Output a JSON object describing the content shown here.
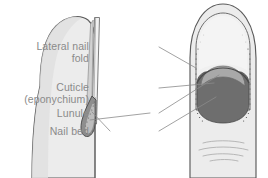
{
  "figure": {
    "width": 268,
    "height": 178,
    "background": "#ffffff"
  },
  "labels": [
    {
      "id": "lateral-nail-fold",
      "line1": "Lateral nail",
      "line2": "fold",
      "color": "#8a8a8a"
    },
    {
      "id": "cuticle",
      "line1": "Cuticle",
      "line2": "(eponychium)",
      "color": "#8a8a8a"
    },
    {
      "id": "lunule",
      "line1": "Lunule",
      "line2": "",
      "color": "#8a8a8a"
    },
    {
      "id": "nail-bed",
      "line1": "Nail bed",
      "line2": "",
      "color": "#8a8a8a"
    }
  ],
  "colors": {
    "skin_light": "#ececec",
    "skin_fill": "#e6e6e6",
    "outline": "#5a5a5a",
    "nail_plate": "#efefef",
    "nail_plate_edge": "#8c8c8c",
    "lunule": "#a8a8a8",
    "nail_bed": "#6e6e6e",
    "nail_root_dark": "#7a7a7a",
    "leader_line": "#8a8a8a",
    "crease_line": "#b4b4b4",
    "label_text": "#8a8a8a"
  },
  "illustrations": {
    "lateral_view": {
      "name": "lateral-section-fingertip",
      "description": "Sagittal cross-section of fingertip showing nail plate along dorsal surface and nail root wedge"
    },
    "dorsal_view": {
      "name": "dorsal-fingertip",
      "description": "Top-down view of fingertip showing nail plate, lateral nail folds, cuticle, lunule and nail bed"
    }
  }
}
